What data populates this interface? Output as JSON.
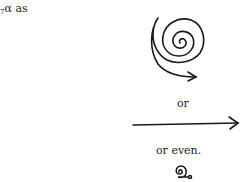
{
  "text": {
    "lead_subscript": "7",
    "lead_symbol": "α",
    "lead_word": " as",
    "or_1": "or",
    "or_even": "or even."
  },
  "figures": [
    {
      "name": "large-spiral-arrow-icon",
      "description": "hand-drawn spiral ending in arrow"
    },
    {
      "name": "straight-arrow-icon",
      "description": "hand-drawn long right-pointing arrow"
    },
    {
      "name": "small-spiral-icon",
      "description": "tiny tight spiral ending in a small loop"
    }
  ]
}
